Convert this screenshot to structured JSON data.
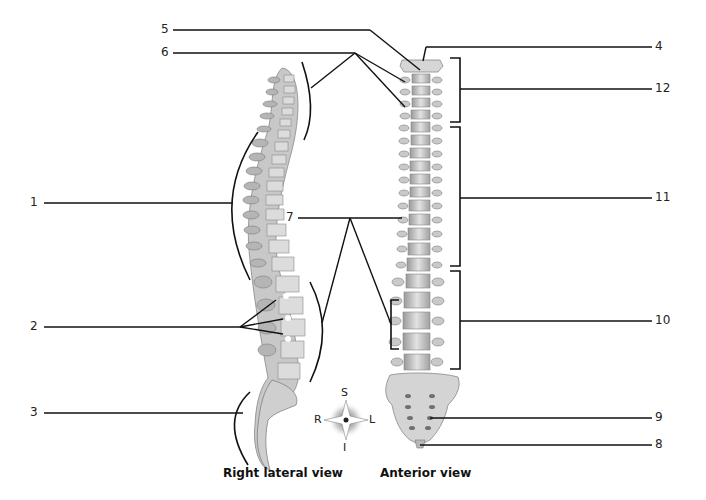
{
  "diagram": {
    "captions": {
      "lateral": "Right lateral view",
      "anterior": "Anterior view"
    },
    "compass": {
      "superior": "S",
      "inferior": "I",
      "right": "R",
      "left": "L"
    },
    "labels": [
      {
        "id": "1",
        "text": "1"
      },
      {
        "id": "2",
        "text": "2"
      },
      {
        "id": "3",
        "text": "3"
      },
      {
        "id": "4",
        "text": "4"
      },
      {
        "id": "5",
        "text": "5"
      },
      {
        "id": "6",
        "text": "6"
      },
      {
        "id": "7",
        "text": "7"
      },
      {
        "id": "8",
        "text": "8"
      },
      {
        "id": "9",
        "text": "9"
      },
      {
        "id": "10",
        "text": "10"
      },
      {
        "id": "11",
        "text": "11"
      },
      {
        "id": "12",
        "text": "12"
      }
    ]
  },
  "colors": {
    "bone": "#d2d2d2",
    "bone_dark": "#8e8e8e",
    "line": "#1a1a1a",
    "background": "#ffffff"
  }
}
